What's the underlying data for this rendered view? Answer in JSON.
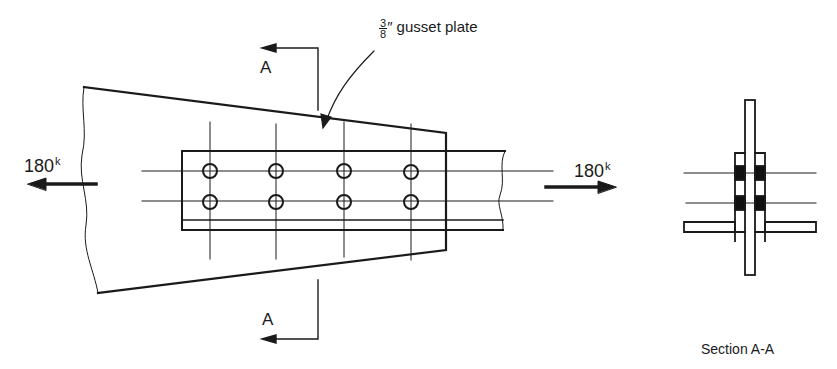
{
  "diagram": {
    "gusset_label": {
      "fraction_num": "3",
      "fraction_den": "8",
      "unit": "″",
      "text": "gusset plate"
    },
    "force_left": {
      "value": "180",
      "unit": "k"
    },
    "force_right": {
      "value": "180",
      "unit": "k"
    },
    "section_marker_top": "A",
    "section_marker_bottom": "A",
    "section_caption": "Section A-A",
    "bolt_rows": 2,
    "bolt_columns": 4,
    "colors": {
      "line": "#1a1a1a",
      "background": "#ffffff",
      "filler": "#111111"
    }
  }
}
